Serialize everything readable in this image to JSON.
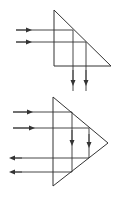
{
  "figure": {
    "colors": {
      "stroke": "#333333",
      "background": "#ffffff"
    },
    "top_prism": {
      "shape": "right-triangle",
      "vertices": [
        [
          54,
          10
        ],
        [
          54,
          66
        ],
        [
          111,
          66
        ]
      ],
      "rays": [
        {
          "in_y": 30,
          "start_x": 16,
          "turn_x": 73,
          "out_y_end": 91,
          "arrow_in_x": 28,
          "arrow_out_y": 82
        },
        {
          "in_y": 42,
          "start_x": 16,
          "turn_x": 86,
          "out_y_end": 91,
          "arrow_in_x": 28,
          "arrow_out_y": 82
        }
      ]
    },
    "bottom_prism": {
      "shape": "isoceles-triangle",
      "vertices": [
        [
          53,
          97
        ],
        [
          53,
          186
        ],
        [
          108,
          143
        ]
      ],
      "rays": [
        {
          "in_y": 112,
          "out_y": 172,
          "turn_x": 72,
          "start_x": 13,
          "arrow_in_x": 29,
          "arrow_down_y": 142
        },
        {
          "in_y": 128,
          "out_y": 158,
          "turn_x": 89,
          "start_x": 13,
          "arrow_in_x": 31,
          "arrow_down_y": 142
        }
      ]
    }
  }
}
